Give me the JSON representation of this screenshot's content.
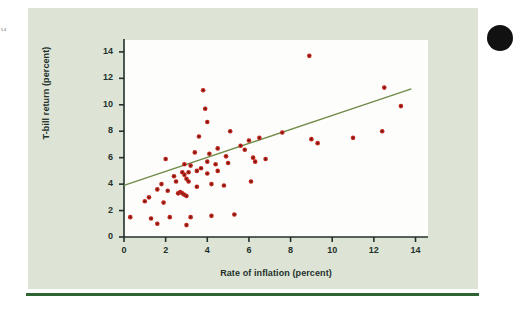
{
  "figure": {
    "margin_note": "5\n4",
    "panel_color": "#dde4d5",
    "plot_background": "#fdfdfb",
    "rule_color": "#2f6434",
    "point_color": "#c0281e",
    "trendline_color": "#6f8c48",
    "axis_color": "#23302b"
  },
  "chart_data": {
    "type": "scatter",
    "title": "",
    "xlabel": "Rate of inflation (percent)",
    "ylabel": "T-bill return (percent)",
    "xlim": [
      0,
      14.6
    ],
    "ylim": [
      0,
      14.9
    ],
    "xticks": [
      0,
      2,
      4,
      6,
      8,
      10,
      12,
      14
    ],
    "yticks": [
      0,
      2,
      4,
      6,
      8,
      10,
      12,
      14
    ],
    "xtick_labels": [
      "0",
      "2",
      "4",
      "6",
      "8",
      "10",
      "12",
      "14"
    ],
    "ytick_labels": [
      "0",
      "2",
      "4",
      "6",
      "8",
      "10",
      "12",
      "14"
    ],
    "grid": false,
    "legend": null,
    "series": [
      {
        "name": "T-bill return vs inflation",
        "marker": "filled-circle",
        "color": "#c0281e",
        "points": [
          [
            0.3,
            1.5
          ],
          [
            1.0,
            2.7
          ],
          [
            1.2,
            3.0
          ],
          [
            1.3,
            1.4
          ],
          [
            1.6,
            3.6
          ],
          [
            1.6,
            1.0
          ],
          [
            1.8,
            4.0
          ],
          [
            1.9,
            2.6
          ],
          [
            2.0,
            5.9
          ],
          [
            2.1,
            3.5
          ],
          [
            2.2,
            1.5
          ],
          [
            2.4,
            4.6
          ],
          [
            2.5,
            4.2
          ],
          [
            2.6,
            3.3
          ],
          [
            2.7,
            3.4
          ],
          [
            2.8,
            4.9
          ],
          [
            2.8,
            3.3
          ],
          [
            2.9,
            5.5
          ],
          [
            2.9,
            4.7
          ],
          [
            2.9,
            3.2
          ],
          [
            3.0,
            4.4
          ],
          [
            3.0,
            3.1
          ],
          [
            3.0,
            0.9
          ],
          [
            3.1,
            4.9
          ],
          [
            3.1,
            4.2
          ],
          [
            3.2,
            5.4
          ],
          [
            3.2,
            1.5
          ],
          [
            3.4,
            6.4
          ],
          [
            3.5,
            5.0
          ],
          [
            3.5,
            3.8
          ],
          [
            3.6,
            7.6
          ],
          [
            3.7,
            5.2
          ],
          [
            3.8,
            11.1
          ],
          [
            3.9,
            9.7
          ],
          [
            4.0,
            8.7
          ],
          [
            4.0,
            5.7
          ],
          [
            4.0,
            4.8
          ],
          [
            4.1,
            6.3
          ],
          [
            4.2,
            4.0
          ],
          [
            4.2,
            1.6
          ],
          [
            4.4,
            5.5
          ],
          [
            4.5,
            6.7
          ],
          [
            4.5,
            5.0
          ],
          [
            4.8,
            3.9
          ],
          [
            4.9,
            6.1
          ],
          [
            5.0,
            5.6
          ],
          [
            5.1,
            8.0
          ],
          [
            5.3,
            1.7
          ],
          [
            5.6,
            6.9
          ],
          [
            5.8,
            6.6
          ],
          [
            6.0,
            7.3
          ],
          [
            6.1,
            4.2
          ],
          [
            6.2,
            6.0
          ],
          [
            6.3,
            5.7
          ],
          [
            6.5,
            7.5
          ],
          [
            6.8,
            5.9
          ],
          [
            7.6,
            7.9
          ],
          [
            8.9,
            13.7
          ],
          [
            9.0,
            7.4
          ],
          [
            9.3,
            7.1
          ],
          [
            11.0,
            7.5
          ],
          [
            12.4,
            8.0
          ],
          [
            12.5,
            11.3
          ],
          [
            13.3,
            9.9
          ]
        ]
      }
    ],
    "trendline": {
      "type": "linear-fit",
      "color": "#6f8c48",
      "x_start": 0.0,
      "y_start": 3.9,
      "x_end": 13.8,
      "y_end": 11.2
    }
  }
}
